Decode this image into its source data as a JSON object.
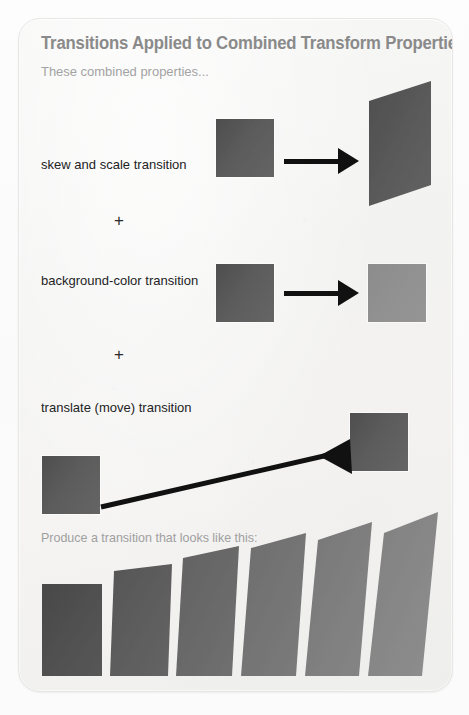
{
  "figure": {
    "title": "Transitions Applied to Combined Transform Properties",
    "subtitle": "These combined properties...",
    "produce_label": "Produce a transition that looks like this:",
    "caption": "",
    "colors": {
      "card_background": "#f4f4f3",
      "card_border": "#e6e6e4",
      "title_text": "#8b8b8b",
      "subtitle_text": "#a3a3a3",
      "label_text": "#232323",
      "arrow": "#111111",
      "square_dark": "#565656",
      "square_light": "#919191"
    }
  },
  "rows": [
    {
      "id": "skew-scale",
      "label": "skew and scale transition",
      "operator": "+",
      "from_shape": {
        "kind": "square",
        "fill": "#565656",
        "width": 58,
        "height": 58
      },
      "to_shape": {
        "kind": "parallelogram",
        "fill": "#5a5a5a",
        "width": 78,
        "height": 105,
        "skew_deg": -9
      },
      "arrow": {
        "kind": "straight",
        "direction": "right"
      }
    },
    {
      "id": "background-color",
      "label": "background-color transition",
      "operator": "+",
      "from_shape": {
        "kind": "square",
        "fill": "#565656",
        "width": 58,
        "height": 58
      },
      "to_shape": {
        "kind": "square",
        "fill": "#919191",
        "width": 58,
        "height": 58
      },
      "arrow": {
        "kind": "straight",
        "direction": "right"
      }
    },
    {
      "id": "translate-move",
      "label": "translate (move) transition",
      "operator": "",
      "from_shape": {
        "kind": "square",
        "fill": "#565656",
        "width": 58,
        "height": 58
      },
      "to_shape": {
        "kind": "square",
        "fill": "#565656",
        "width": 58,
        "height": 58
      },
      "arrow": {
        "kind": "diagonal",
        "direction": "up-right"
      }
    }
  ],
  "result_sequence": {
    "count": 6,
    "frames": [
      {
        "index": 1,
        "fill": "#4f4f4f",
        "skew_deg": 0,
        "height": 92,
        "width": 60
      },
      {
        "index": 2,
        "fill": "#5c5c5c",
        "skew_deg": -4,
        "height": 104,
        "width": 58
      },
      {
        "index": 3,
        "fill": "#686868",
        "skew_deg": -7,
        "height": 114,
        "width": 56
      },
      {
        "index": 4,
        "fill": "#747474",
        "skew_deg": -9,
        "height": 122,
        "width": 55
      },
      {
        "index": 5,
        "fill": "#7e7e7e",
        "skew_deg": -11,
        "height": 130,
        "width": 54
      },
      {
        "index": 6,
        "fill": "#878787",
        "skew_deg": -13,
        "height": 138,
        "width": 54
      }
    ]
  }
}
